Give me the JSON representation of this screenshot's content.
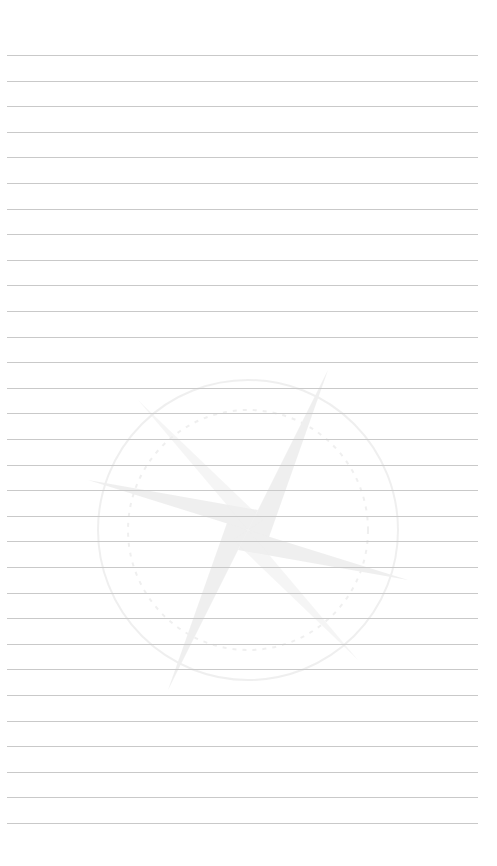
{
  "page": {
    "type": "lined-paper",
    "background_color": "#ffffff",
    "line_color": "#c9c9c9",
    "line_count": 31,
    "first_line_y": 55,
    "line_spacing": 25.6,
    "line_left": 7,
    "line_right": 478
  },
  "watermark": {
    "icon": "compass-rose-icon",
    "description": "faint compass rose star within a circle"
  }
}
